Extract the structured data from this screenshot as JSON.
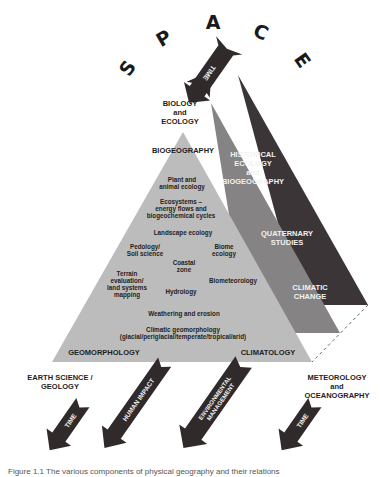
{
  "title_word": {
    "letters": [
      {
        "char": "S",
        "x": 133,
        "y": 72,
        "rot": -55
      },
      {
        "char": "P",
        "x": 167,
        "y": 44,
        "rot": -30
      },
      {
        "char": "A",
        "x": 213,
        "y": 29,
        "rot": 0
      },
      {
        "char": "C",
        "x": 258,
        "y": 38,
        "rot": 25
      },
      {
        "char": "E",
        "x": 297,
        "y": 64,
        "rot": 55
      }
    ]
  },
  "colors": {
    "dark_triangle": "#3b3537",
    "mid_triangle": "#858384",
    "light_triangle": "#bdbcbc",
    "arrow": "#302a2b",
    "text_dark": "#1e1e1e",
    "text_light": "#f2f2f2"
  },
  "triangles": {
    "dark": {
      "points": "238,75 368,305 300,305"
    },
    "mid": {
      "points": "211,103 340,333 248,333"
    },
    "light": {
      "points": "183,132 312,362 52,362"
    }
  },
  "labels": {
    "biology_ecology": [
      "BIOLOGY",
      "and",
      "ECOLOGY"
    ],
    "biogeography": "BIOGEOGRAPHY",
    "historical": [
      "HISTORICAL",
      "ECOLOGY",
      "and",
      "BIOGEOGRAPHY"
    ],
    "quaternary": [
      "QUATERNARY",
      "STUDIES"
    ],
    "climatic_change": [
      "CLIMATIC",
      "CHANGE"
    ],
    "geomorphology": "GEOMORPHOLOGY",
    "climatology": "CLIMATOLOGY",
    "earth_science": [
      "EARTH SCIENCE /",
      "GEOLOGY"
    ],
    "meteorology": [
      "METEOROLOGY",
      "and",
      "OCEANOGRAPHY"
    ]
  },
  "inner_topics": {
    "plant_animal": [
      "Plant and",
      "animal ecology"
    ],
    "ecosystems": [
      "Ecosystems –",
      "energy flows and",
      "biogeochemical cycles"
    ],
    "landscape": "Landscape ecology",
    "pedology": [
      "Pedology/",
      "Soil science"
    ],
    "biome": [
      "Biome",
      "ecology"
    ],
    "coastal": [
      "Coastal",
      "zone"
    ],
    "terrain": [
      "Terrain",
      "evaluation/",
      "land systems",
      "mapping"
    ],
    "hydrology": "Hydrology",
    "biometeorology": "Biometeorology",
    "weathering": "Weathering and erosion",
    "climatic_geomorph": [
      "Climatic geomorphology",
      "(glacial/periglacial/temperate/tropical/arid)"
    ]
  },
  "arrows": {
    "top_time": "TIME",
    "bottom": [
      {
        "label": "TIME",
        "cx": 70,
        "cy": 425,
        "len": 62
      },
      {
        "label": "HUMAN IMPACT",
        "cx": 138,
        "cy": 402,
        "len": 108
      },
      {
        "label": "ENVIRONMENTAL MANAGEMENT",
        "cx": 217,
        "cy": 402,
        "len": 108
      },
      {
        "label": "TIME",
        "cx": 300,
        "cy": 425,
        "len": 62
      }
    ],
    "bottom_label_lines": {
      "env": [
        "ENVIRONMENTAL",
        "MANAGEMENT"
      ]
    }
  },
  "caption": "Figure 1.1  The various components of physical geography and their relations"
}
